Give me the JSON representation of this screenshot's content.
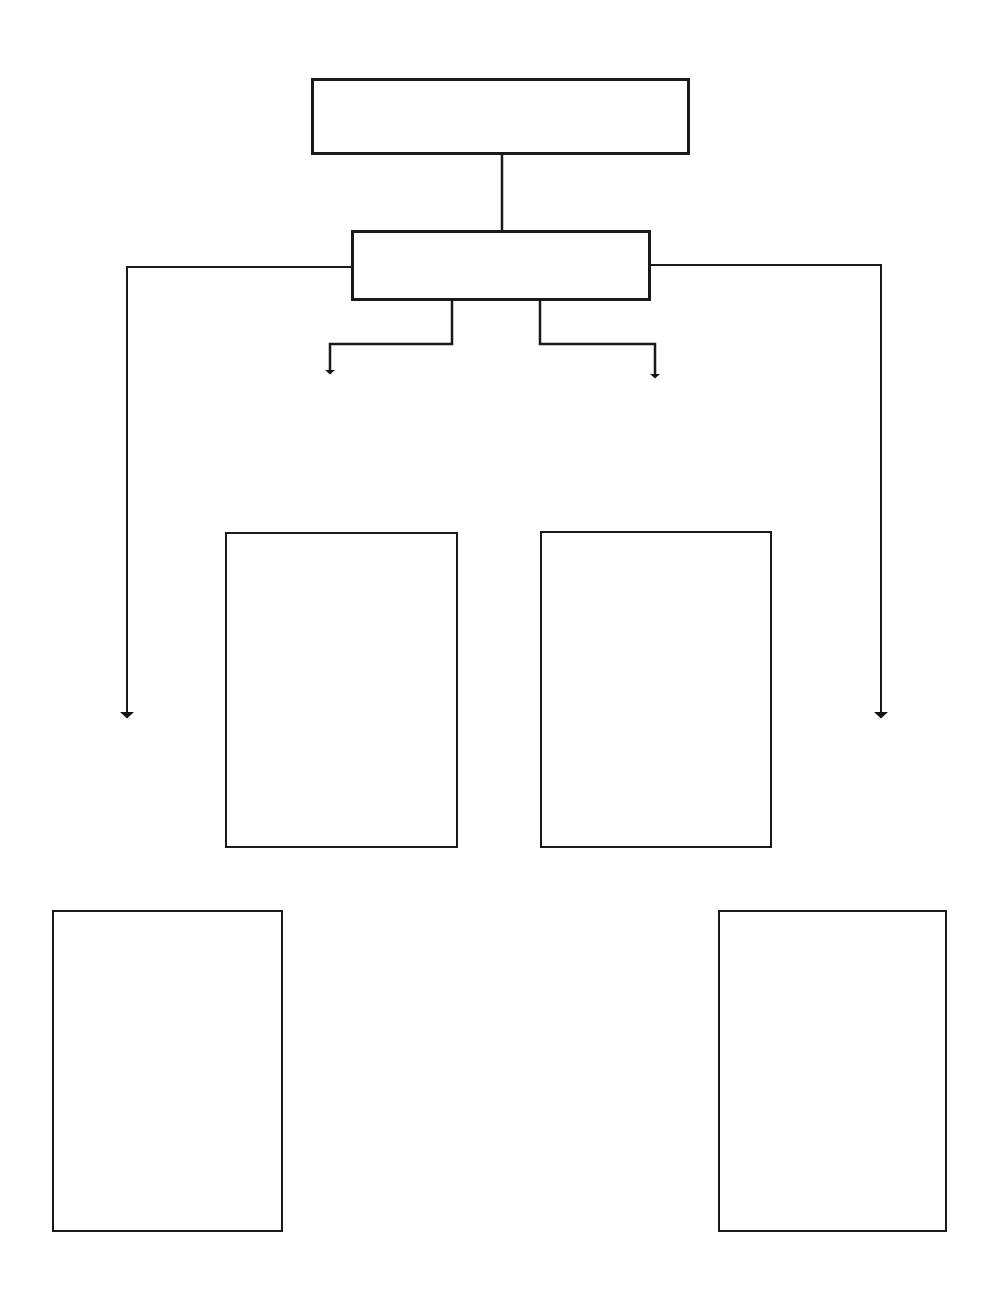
{
  "page": {
    "width": 999,
    "height": 1310,
    "background_color": "#ffffff",
    "stroke_color": "#1a1a1a"
  },
  "diagram": {
    "type": "block-flowchart",
    "orientation": "top-down",
    "nodes": [
      {
        "id": "node-top",
        "name": "top-box",
        "label": "",
        "shape": "rectangle",
        "x": 311,
        "y": 78,
        "width": 379,
        "height": 77,
        "border_width": 3,
        "fill": "#ffffff"
      },
      {
        "id": "node-second",
        "name": "second-box",
        "label": "",
        "shape": "rectangle",
        "x": 351,
        "y": 230,
        "width": 300,
        "height": 71,
        "border_width": 3,
        "fill": "#ffffff"
      },
      {
        "id": "node-middle-left",
        "name": "middle-left-box",
        "label": "",
        "shape": "rectangle",
        "x": 225,
        "y": 532,
        "width": 233,
        "height": 316,
        "border_width": 2,
        "fill": "#ffffff"
      },
      {
        "id": "node-middle-right",
        "name": "middle-right-box",
        "label": "",
        "shape": "rectangle",
        "x": 540,
        "y": 531,
        "width": 232,
        "height": 317,
        "border_width": 2,
        "fill": "#ffffff"
      },
      {
        "id": "node-bottom-left",
        "name": "bottom-left-box",
        "label": "",
        "shape": "rectangle",
        "x": 52,
        "y": 910,
        "width": 231,
        "height": 322,
        "border_width": 2,
        "fill": "#ffffff"
      },
      {
        "id": "node-bottom-right",
        "name": "bottom-right-box",
        "label": "",
        "shape": "rectangle",
        "x": 718,
        "y": 910,
        "width": 229,
        "height": 322,
        "border_width": 2,
        "fill": "#ffffff"
      }
    ],
    "connectors": [
      {
        "id": "connector-top-to-second",
        "name": "connector-top-to-second",
        "from": "node-top",
        "to": "node-second",
        "arrowhead": false,
        "stroke_width": 2.5,
        "points": "502,155 502,230"
      },
      {
        "id": "connector-second-to-inner-left",
        "name": "connector-second-to-inner-left-arrow",
        "from": "node-second",
        "to": "node-middle-left",
        "arrowhead": true,
        "stroke_width": 2.5,
        "points": "452,301 452,344 330,344 330,372"
      },
      {
        "id": "connector-second-to-inner-right",
        "name": "connector-second-to-inner-right-arrow",
        "from": "node-second",
        "to": "node-middle-right",
        "arrowhead": true,
        "stroke_width": 2.5,
        "points": "540,301 540,344 655,344 655,376"
      },
      {
        "id": "connector-second-to-outer-left",
        "name": "connector-second-to-outer-left-arrow",
        "from": "node-second",
        "to": "node-bottom-left",
        "arrowhead": true,
        "stroke_width": 2.0,
        "points": "351,267 127,267 127,715"
      },
      {
        "id": "connector-second-to-outer-right",
        "name": "connector-second-to-outer-right-arrow",
        "from": "node-second",
        "to": "node-bottom-right",
        "arrowhead": true,
        "stroke_width": 2.0,
        "points": "651,265 881,265 881,715"
      }
    ]
  }
}
